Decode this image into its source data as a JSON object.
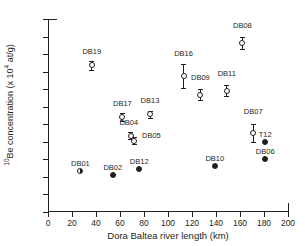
{
  "chart_data": {
    "type": "scatter",
    "title": "",
    "xlabel": "Dora Baltea river length (km)",
    "ylabel_html": "<sup>10</sup>Be concentration (x 10<sup>4</sup> at/g)",
    "ylabel_text": "10Be concentration (x 10^4 at/g)",
    "xlim": [
      0,
      200
    ],
    "ylim": [
      0,
      5.5
    ],
    "xticks": [
      0,
      20,
      40,
      60,
      80,
      100,
      120,
      140,
      160,
      180,
      200
    ],
    "xticklabels": [
      "0",
      "20",
      "40",
      "60",
      "80",
      "100",
      "120",
      "140",
      "160",
      "180",
      "200"
    ],
    "yticks": [
      0,
      0.5,
      1,
      1.5,
      2,
      2.5,
      3,
      3.5,
      4,
      4.5,
      5,
      5.5
    ],
    "yticklabels": [
      "0",
      "0.5",
      "1",
      "1.5",
      "2",
      "2.5",
      "3",
      "3.5",
      "4",
      "4.5",
      "5",
      "5.5"
    ],
    "grid": false,
    "legend": "none",
    "marker_colors": {
      "outline": "#231f20",
      "open_fill": "#ffffff",
      "filled_fill": "#231f20"
    },
    "points": [
      {
        "label": "DB01",
        "x": 27,
        "y": 1.18,
        "yerr": 0,
        "style": "half",
        "label_dx": 0,
        "label_dy": -11
      },
      {
        "label": "DB02",
        "x": 54,
        "y": 1.05,
        "yerr": 0,
        "style": "filled",
        "label_dx": 0,
        "label_dy": -11
      },
      {
        "label": "DB19",
        "x": 36.5,
        "y": 4.18,
        "yerr": 0.12,
        "style": "open",
        "label_dx": 0,
        "label_dy": -17
      },
      {
        "label": "DB17",
        "x": 62,
        "y": 2.7,
        "yerr": 0.12,
        "style": "open",
        "label_dx": 0,
        "label_dy": -17
      },
      {
        "label": "DB04",
        "x": 69,
        "y": 2.18,
        "yerr": 0.1,
        "style": "open",
        "label_dx": -2,
        "label_dy": -17
      },
      {
        "label": "DB05",
        "x": 72,
        "y": 2.03,
        "yerr": 0.1,
        "style": "open",
        "label_dx": 17,
        "label_dy": -9
      },
      {
        "label": "DB12",
        "x": 76,
        "y": 1.23,
        "yerr": 0,
        "style": "filled",
        "label_dx": 0,
        "label_dy": -11
      },
      {
        "label": "DB13",
        "x": 85,
        "y": 2.78,
        "yerr": 0.11,
        "style": "open",
        "label_dx": 0,
        "label_dy": -17
      },
      {
        "label": "DB16",
        "x": 113,
        "y": 3.88,
        "yerr": 0.34,
        "style": "open",
        "label_dx": 0,
        "label_dy": -26
      },
      {
        "label": "DB09",
        "x": 127,
        "y": 3.34,
        "yerr": 0.16,
        "style": "open",
        "label_dx": 0,
        "label_dy": -21
      },
      {
        "label": "DB10",
        "x": 139,
        "y": 1.31,
        "yerr": 0,
        "style": "filled",
        "label_dx": 0,
        "label_dy": -11
      },
      {
        "label": "DB11",
        "x": 149,
        "y": 3.46,
        "yerr": 0.15,
        "style": "open",
        "label_dx": 0,
        "label_dy": -21
      },
      {
        "label": "DB08",
        "x": 162,
        "y": 4.82,
        "yerr": 0.17,
        "style": "open",
        "label_dx": 0,
        "label_dy": -21
      },
      {
        "label": "DB07",
        "x": 171,
        "y": 2.25,
        "yerr": 0.25,
        "style": "open",
        "label_dx": 0,
        "label_dy": -25
      },
      {
        "label": "T12",
        "x": 181,
        "y": 2.0,
        "yerr": 0,
        "style": "filled",
        "label_dx": 0,
        "label_dy": -11
      },
      {
        "label": "DB06",
        "x": 181,
        "y": 1.5,
        "yerr": 0,
        "style": "filled",
        "label_dx": 0,
        "label_dy": -11
      }
    ]
  }
}
